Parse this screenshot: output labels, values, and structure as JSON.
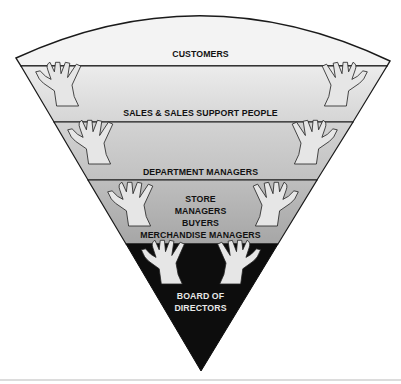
{
  "diagram": {
    "type": "inverted-pyramid",
    "colors": {
      "customers": "#f2f2f2",
      "sales_top": "#ebebeb",
      "sales_bottom": "#d6d6d6",
      "dept_top": "#d2d2d2",
      "dept_bottom": "#c2c2c2",
      "store_top": "#bdbdbd",
      "store_bottom": "#a7a7a7",
      "board": "#0d0d0d",
      "outline": "#1a1a1a",
      "hand_fill": "#e6e6e6"
    },
    "layers": [
      {
        "id": "customers",
        "lines": [
          "CUSTOMERS"
        ]
      },
      {
        "id": "sales",
        "lines": [
          "SALES & SALES SUPPORT PEOPLE"
        ]
      },
      {
        "id": "department",
        "lines": [
          "DEPARTMENT MANAGERS"
        ]
      },
      {
        "id": "store",
        "lines": [
          "STORE",
          "MANAGERS",
          "BUYERS",
          "MERCHANDISE MANAGERS"
        ]
      },
      {
        "id": "board",
        "lines": [
          "BOARD OF",
          "DIRECTORS"
        ]
      }
    ]
  }
}
